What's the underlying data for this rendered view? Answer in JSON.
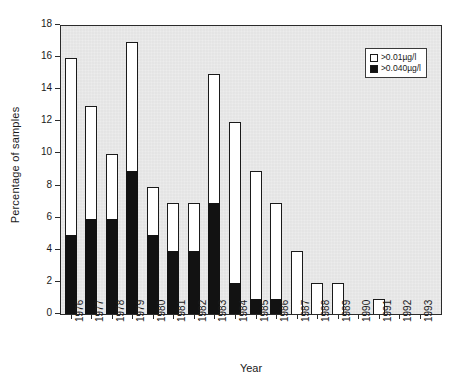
{
  "chart_data": {
    "type": "bar",
    "title": "",
    "xlabel": "Year",
    "ylabel": "Percentage of samples",
    "ylim": [
      0,
      18
    ],
    "ytick_step": 2,
    "yticks": [
      0,
      2,
      4,
      6,
      8,
      10,
      12,
      14,
      16,
      18
    ],
    "grid": false,
    "legend_position": "top-right",
    "stacked": true,
    "categories": [
      "1976",
      "1977",
      "1978",
      "1979",
      "1980",
      "1981",
      "1982",
      "1983",
      "1984",
      "1985",
      "1986",
      "1987",
      "1988",
      "1989",
      "1990",
      "1991",
      "1992",
      "1993"
    ],
    "series": [
      {
        "name": ">0.01µg/l",
        "swatch": "hollow",
        "values": [
          16,
          13,
          10,
          17,
          8,
          7,
          7,
          15,
          12,
          9,
          7,
          4,
          2,
          2,
          0,
          1,
          0,
          0
        ]
      },
      {
        "name": ">0.040µg/l",
        "swatch": "filled",
        "values": [
          5,
          6,
          6,
          9,
          5,
          4,
          4,
          7,
          2,
          1,
          1,
          0,
          0,
          0,
          0,
          0,
          0,
          0
        ]
      }
    ]
  },
  "axes": {
    "ylabel": "Percentage of samples",
    "xlabel": "Year",
    "ytick_labels": [
      "0",
      "2",
      "4",
      "6",
      "8",
      "10",
      "12",
      "14",
      "16",
      "18"
    ],
    "xtick_labels": [
      "1976",
      "1977",
      "1978",
      "1979",
      "1980",
      "1981",
      "1982",
      "1983",
      "1984",
      "1985",
      "1986",
      "1987",
      "1988",
      "1989",
      "1990",
      "1991",
      "1992",
      "1993"
    ]
  },
  "legend": {
    "items": [
      {
        "label": ">0.01µg/l",
        "swatch": "hollow"
      },
      {
        "label": ">0.040µg/l",
        "swatch": "filled"
      }
    ]
  },
  "colors": {
    "series_hollow": "#ffffff",
    "series_filled": "#121212",
    "plot_background": "#ececec",
    "axis": "#2b2b2b",
    "page_background": "#ffffff"
  }
}
